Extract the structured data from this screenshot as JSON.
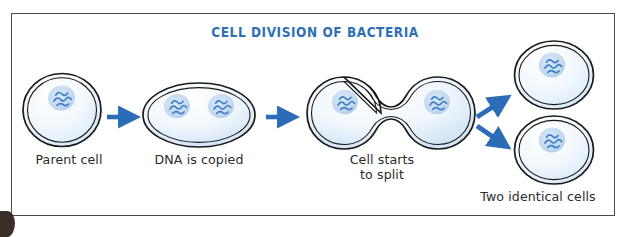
{
  "figure": {
    "title": "CELL DIVISION OF BACTERIA",
    "title_color": "#2f6fb5",
    "frame_color": "#4a4a4a",
    "arrow_color": "#2a6cb8",
    "cell_outline_color": "#1a1a1a",
    "cell_fill_light": "#ffffff",
    "cell_fill_tint": "#dce9f6",
    "nucleoid_fill": "#bcd6ef",
    "dna_color": "#3b7fc4",
    "background": "#ffffff"
  },
  "stages": [
    {
      "id": "stage-1",
      "label": "Parent cell",
      "shape": "round-cell",
      "nucleoid_count": 1
    },
    {
      "id": "stage-2",
      "label": "DNA is copied",
      "shape": "oval-cell",
      "nucleoid_count": 2
    },
    {
      "id": "stage-3",
      "label": "Cell starts\nto split",
      "shape": "dumbbell-cell",
      "nucleoid_count": 2
    },
    {
      "id": "stage-4",
      "label": "Two identical cells",
      "shape": "two-round-cells",
      "nucleoid_count": 2
    }
  ],
  "arrows": [
    {
      "id": "arrow-1",
      "direction": "right",
      "from": "stage-1",
      "to": "stage-2"
    },
    {
      "id": "arrow-2",
      "direction": "right",
      "from": "stage-2",
      "to": "stage-3"
    },
    {
      "id": "arrow-3",
      "direction": "up-right",
      "from": "stage-3",
      "to": "stage-4-top"
    },
    {
      "id": "arrow-4",
      "direction": "down-right",
      "from": "stage-3",
      "to": "stage-4-bottom"
    }
  ]
}
